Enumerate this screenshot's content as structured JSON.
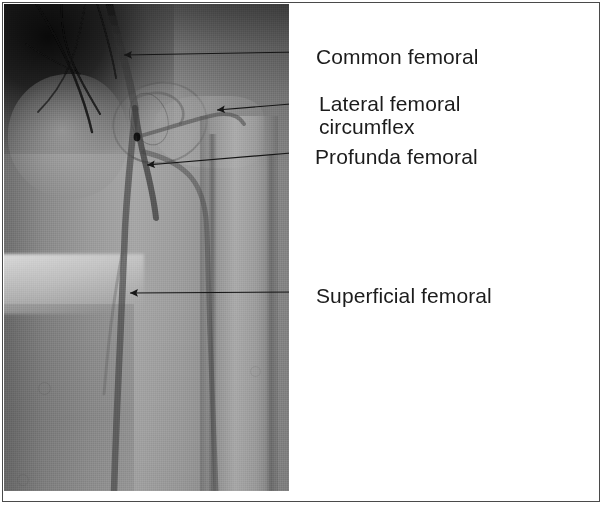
{
  "figure": {
    "type": "angiogram",
    "modality": "x-ray arteriogram",
    "region": "right groin and thigh",
    "border_color": "#4a4a4a",
    "background_color": "#ffffff",
    "text_color": "#1c1c1c"
  },
  "annotations": [
    {
      "id": "common-femoral",
      "label": "Common femoral",
      "arrow_tip": {
        "x": 122,
        "y": 55
      },
      "leader_end": {
        "x": 303,
        "y": 52
      }
    },
    {
      "id": "lateral-femoral-circumflex",
      "label_line_1": "Lateral femoral",
      "label_line_2": "circumflex",
      "label": "Lateral femoral circumflex",
      "arrow_tip": {
        "x": 215,
        "y": 110
      },
      "leader_end": {
        "x": 303,
        "y": 103
      }
    },
    {
      "id": "profunda-femoral",
      "label": "Profunda femoral",
      "arrow_tip": {
        "x": 145,
        "y": 165
      },
      "leader_end": {
        "x": 303,
        "y": 152
      }
    },
    {
      "id": "superficial-femoral",
      "label": "Superficial femoral",
      "arrow_tip": {
        "x": 128,
        "y": 293
      },
      "leader_end": {
        "x": 303,
        "y": 292
      }
    }
  ],
  "panel": {
    "angiogram_bounds": {
      "x": 4,
      "y": 4,
      "width": 285,
      "height": 487
    },
    "label_bounds": {
      "x": 289,
      "y": 4,
      "width": 311,
      "height": 487
    }
  }
}
